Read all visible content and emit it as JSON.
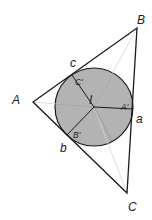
{
  "colors": {
    "stroke": "#1a1a1a",
    "circle_fill": "#b3b3b3",
    "bisector": "#c8c8c8",
    "background": "#ffffff"
  },
  "vertices": {
    "A": {
      "label": "A",
      "x": 33,
      "y": 102
    },
    "B": {
      "label": "B",
      "x": 137,
      "y": 28
    },
    "C": {
      "label": "C",
      "x": 127,
      "y": 193
    }
  },
  "incenter": {
    "label": "I",
    "x": 94,
    "y": 107,
    "r": 39
  },
  "tangent_points": {
    "A_prime": {
      "label": "A'",
      "x": 133,
      "y": 109
    },
    "B_prime": {
      "label": "B'",
      "x": 67,
      "y": 135
    },
    "C_prime": {
      "label": "C'",
      "x": 72,
      "y": 75
    }
  },
  "side_labels": {
    "a": {
      "label": "a"
    },
    "b": {
      "label": "b"
    },
    "c": {
      "label": "c"
    }
  }
}
